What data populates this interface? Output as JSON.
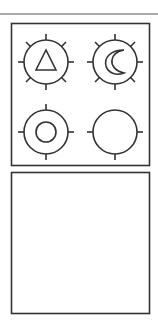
{
  "colors": {
    "stroke": "#333333",
    "background": "#ffffff",
    "top_rule": "#555555"
  },
  "panels": [
    {
      "name": "symbol-grid-panel",
      "symbols": [
        {
          "position": "top-left",
          "icon": "sun-with-triangle-icon",
          "inner": "triangle",
          "rays": 8
        },
        {
          "position": "top-right",
          "icon": "sun-with-crescent-icon",
          "inner": "crescent",
          "rays": 8
        },
        {
          "position": "bottom-left",
          "icon": "sun-with-circle-icon",
          "inner": "circle",
          "rays": 4
        },
        {
          "position": "bottom-right",
          "icon": "empty-circle-icon",
          "inner": "none",
          "rays": 3
        }
      ]
    },
    {
      "name": "empty-panel",
      "symbols": []
    }
  ]
}
